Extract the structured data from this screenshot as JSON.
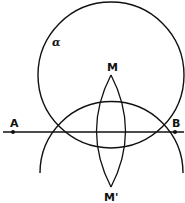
{
  "diagram": {
    "title": "",
    "labels": {
      "circle": "α",
      "point_a": "A",
      "point_b": "B",
      "point_m": "M",
      "point_m_prime": "M'"
    },
    "colors": {
      "stroke": "#111111",
      "background": "#ffffff"
    },
    "elements": [
      {
        "type": "circle",
        "name": "alpha",
        "center": [
          111,
          75
        ],
        "radius": 73
      },
      {
        "type": "line",
        "name": "AB",
        "from": [
          3,
          132
        ],
        "to": [
          184,
          132
        ]
      },
      {
        "type": "arc",
        "name": "lower-arc",
        "center": [
          111,
          183
        ],
        "radius": 71
      },
      {
        "type": "lens",
        "name": "vesica",
        "top": "M",
        "bottom": "M'"
      }
    ]
  }
}
